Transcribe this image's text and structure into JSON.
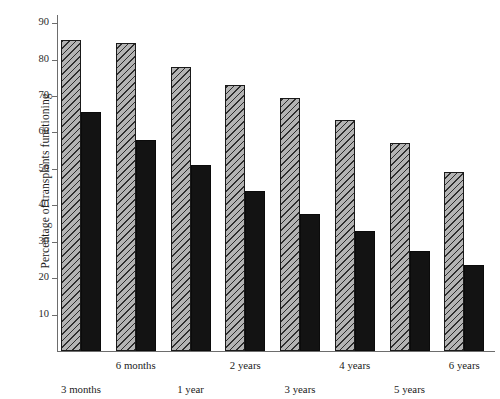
{
  "chart_data": {
    "type": "bar",
    "title": "",
    "subtitle": "",
    "xlabel": "",
    "ylabel": "Percentage of transplants functioning",
    "categories": [
      "3 months",
      "6 months",
      "1 year",
      "2 years",
      "3 years",
      "4 years",
      "5 years",
      "6 years"
    ],
    "series": [
      {
        "name": "hatched",
        "values": [
          85.5,
          84.5,
          78.0,
          73.0,
          69.5,
          63.5,
          57.0,
          49.0
        ]
      },
      {
        "name": "solid",
        "values": [
          65.5,
          58.0,
          51.0,
          44.0,
          37.5,
          33.0,
          27.5,
          23.5
        ]
      }
    ],
    "ylim": [
      0,
      90
    ],
    "yticks": [
      10,
      20,
      30,
      40,
      50,
      60,
      70,
      80,
      90
    ],
    "ytick_labels": [
      "10",
      "20",
      "30",
      "40",
      "50",
      "60",
      "70",
      "80",
      "90"
    ],
    "grid": false,
    "legend": "none",
    "axis_color": "#6d6d6d",
    "hatch_fill_color": "#b4b4b4",
    "hatch_line_color": "#2e2e2e",
    "solid_color": "#131313",
    "background": "#ffffff"
  }
}
